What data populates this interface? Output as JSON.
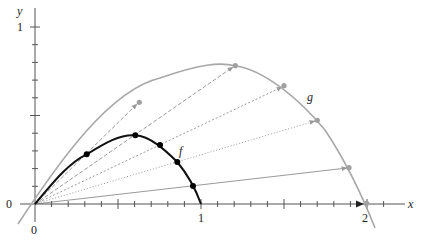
{
  "diagram": {
    "labels": {
      "x_axis": "x",
      "y_axis": "y",
      "origin_x": "0",
      "origin_y": "0",
      "x_tick_1": "1",
      "x_tick_2": "2",
      "y_tick_1": "1",
      "curve_f": "f",
      "curve_g": "g"
    },
    "colors": {
      "axis": "#555555",
      "f_curve": "#111111",
      "g_curve": "#a8a8a8",
      "rays": "#9a9a9a",
      "f_points": "#000000",
      "g_points": "#a0a0a0"
    },
    "f_points": [
      [
        86.7,
        154.3
      ],
      [
        135.3,
        135.3
      ],
      [
        160,
        145
      ],
      [
        177.3,
        162
      ],
      [
        193,
        186
      ]
    ],
    "g_points": [
      [
        139.3,
        102.3
      ],
      [
        235.3,
        65.7
      ],
      [
        284,
        85.7
      ],
      [
        317.3,
        120.3
      ],
      [
        349,
        167.7
      ]
    ]
  }
}
